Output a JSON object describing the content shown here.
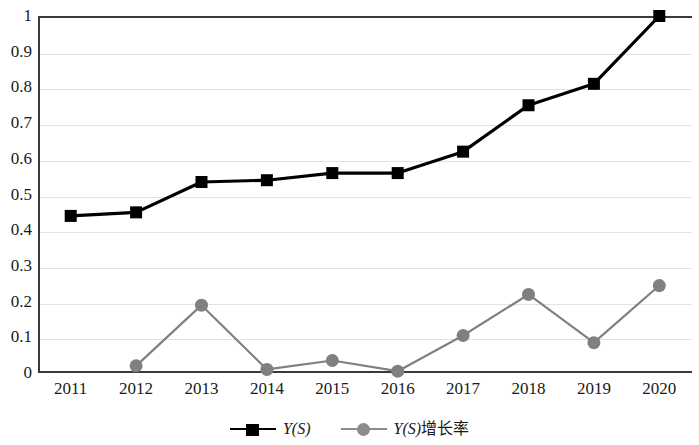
{
  "chart_data": {
    "type": "line",
    "title": "",
    "xlabel": "",
    "ylabel": "",
    "categories": [
      "2011",
      "2012",
      "2013",
      "2014",
      "2015",
      "2016",
      "2017",
      "2018",
      "2019",
      "2020"
    ],
    "ylim": [
      0,
      1
    ],
    "y_ticks": [
      "0",
      "0.1",
      "0.2",
      "0.3",
      "0.4",
      "0.5",
      "0.6",
      "0.7",
      "0.8",
      "0.9",
      "1"
    ],
    "y_tick_values": [
      0,
      0.1,
      0.2,
      0.3,
      0.4,
      0.5,
      0.6,
      0.7,
      0.8,
      0.9,
      1
    ],
    "grid": true,
    "legend_position": "bottom",
    "series": [
      {
        "name": "Y(S)",
        "color": "#000000",
        "marker": "square",
        "values": [
          0.44,
          0.45,
          0.535,
          0.54,
          0.56,
          0.56,
          0.62,
          0.75,
          0.81,
          1.0
        ]
      },
      {
        "name": "Y(S)增长率",
        "color": "#808080",
        "marker": "circle",
        "values": [
          null,
          0.02,
          0.19,
          0.01,
          0.035,
          0.005,
          0.105,
          0.22,
          0.085,
          0.245
        ]
      }
    ]
  },
  "legend": {
    "items": [
      {
        "label_main": "Y(S)",
        "label_suffix": ""
      },
      {
        "label_main": "Y(S)",
        "label_suffix": "增长率"
      }
    ]
  }
}
